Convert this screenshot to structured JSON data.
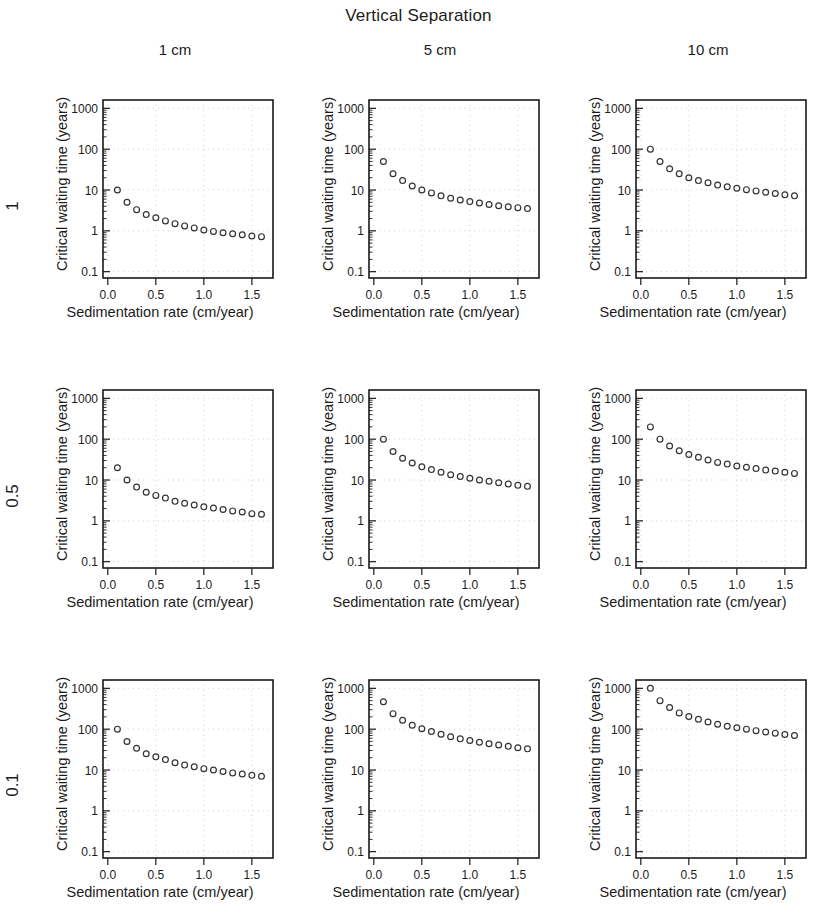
{
  "figure": {
    "title": "Vertical Separation",
    "column_headers": [
      "1 cm",
      "5 cm",
      "10 cm"
    ],
    "row_headers": [
      "1",
      "0.5",
      "0.1"
    ],
    "xlabel": "Sedimentation rate (cm/year)",
    "ylabel": "Critical waiting time (years)",
    "marker_color": "#333333",
    "frame_color": "#1a1a1a",
    "grid_color": "#c8c8c8"
  },
  "chart_data": [
    {
      "type": "scatter",
      "title": "1 cm / 1",
      "row_label": "1",
      "column_label": "1 cm",
      "xlabel": "Sedimentation rate (cm/year)",
      "ylabel": "Critical waiting time (years)",
      "xlim": [
        -0.05,
        1.72
      ],
      "ylim": [
        0.07,
        1600
      ],
      "yscale": "log",
      "xticks": [
        0.0,
        0.5,
        1.0,
        1.5
      ],
      "xticklabels": [
        "0.0",
        "0.5",
        "1.0",
        "1.5"
      ],
      "yticks": [
        0.1,
        1,
        10,
        100,
        1000
      ],
      "yticklabels": [
        "0.1",
        "1",
        "10",
        "100",
        "1000"
      ],
      "grid": true,
      "x": [
        0.1,
        0.2,
        0.3,
        0.4,
        0.5,
        0.6,
        0.7,
        0.8,
        0.9,
        1.0,
        1.1,
        1.2,
        1.3,
        1.4,
        1.5,
        1.6
      ],
      "y": [
        10.0,
        5.0,
        3.3,
        2.5,
        2.1,
        1.75,
        1.5,
        1.32,
        1.18,
        1.05,
        0.97,
        0.9,
        0.85,
        0.8,
        0.75,
        0.72
      ]
    },
    {
      "type": "scatter",
      "title": "5 cm / 1",
      "row_label": "1",
      "column_label": "5 cm",
      "xlabel": "Sedimentation rate (cm/year)",
      "ylabel": "Critical waiting time (years)",
      "xlim": [
        -0.05,
        1.72
      ],
      "ylim": [
        0.07,
        1600
      ],
      "yscale": "log",
      "xticks": [
        0.0,
        0.5,
        1.0,
        1.5
      ],
      "xticklabels": [
        "0.0",
        "0.5",
        "1.0",
        "1.5"
      ],
      "yticks": [
        0.1,
        1,
        10,
        100,
        1000
      ],
      "yticklabels": [
        "0.1",
        "1",
        "10",
        "100",
        "1000"
      ],
      "grid": true,
      "x": [
        0.1,
        0.2,
        0.3,
        0.4,
        0.5,
        0.6,
        0.7,
        0.8,
        0.9,
        1.0,
        1.1,
        1.2,
        1.3,
        1.4,
        1.5,
        1.6
      ],
      "y": [
        50.0,
        25.0,
        17.0,
        12.5,
        10.0,
        8.5,
        7.2,
        6.3,
        5.7,
        5.2,
        4.8,
        4.4,
        4.1,
        3.9,
        3.7,
        3.5
      ]
    },
    {
      "type": "scatter",
      "title": "10 cm / 1",
      "row_label": "1",
      "column_label": "10 cm",
      "xlabel": "Sedimentation rate (cm/year)",
      "ylabel": "Critical waiting time (years)",
      "xlim": [
        -0.05,
        1.72
      ],
      "ylim": [
        0.07,
        1600
      ],
      "yscale": "log",
      "xticks": [
        0.0,
        0.5,
        1.0,
        1.5
      ],
      "xticklabels": [
        "0.0",
        "0.5",
        "1.0",
        "1.5"
      ],
      "yticks": [
        0.1,
        1,
        10,
        100,
        1000
      ],
      "yticklabels": [
        "0.1",
        "1",
        "10",
        "100",
        "1000"
      ],
      "grid": true,
      "x": [
        0.1,
        0.2,
        0.3,
        0.4,
        0.5,
        0.6,
        0.7,
        0.8,
        0.9,
        1.0,
        1.1,
        1.2,
        1.3,
        1.4,
        1.5,
        1.6
      ],
      "y": [
        100.0,
        50.0,
        33.0,
        25.0,
        20.0,
        17.0,
        15.0,
        13.2,
        12.0,
        11.0,
        10.2,
        9.5,
        8.8,
        8.2,
        7.6,
        7.2
      ]
    },
    {
      "type": "scatter",
      "title": "1 cm / 0.5",
      "row_label": "0.5",
      "column_label": "1 cm",
      "xlabel": "Sedimentation rate (cm/year)",
      "ylabel": "Critical waiting time (years)",
      "xlim": [
        -0.05,
        1.72
      ],
      "ylim": [
        0.07,
        1600
      ],
      "yscale": "log",
      "xticks": [
        0.0,
        0.5,
        1.0,
        1.5
      ],
      "xticklabels": [
        "0.0",
        "0.5",
        "1.0",
        "1.5"
      ],
      "yticks": [
        0.1,
        1,
        10,
        100,
        1000
      ],
      "yticklabels": [
        "0.1",
        "1",
        "10",
        "100",
        "1000"
      ],
      "grid": true,
      "x": [
        0.1,
        0.2,
        0.3,
        0.4,
        0.5,
        0.6,
        0.7,
        0.8,
        0.9,
        1.0,
        1.1,
        1.2,
        1.3,
        1.4,
        1.5,
        1.6
      ],
      "y": [
        20.0,
        10.0,
        6.7,
        5.0,
        4.2,
        3.6,
        3.0,
        2.7,
        2.45,
        2.2,
        2.05,
        1.9,
        1.75,
        1.65,
        1.5,
        1.45
      ]
    },
    {
      "type": "scatter",
      "title": "5 cm / 0.5",
      "row_label": "0.5",
      "column_label": "5 cm",
      "xlabel": "Sedimentation rate (cm/year)",
      "ylabel": "Critical waiting time (years)",
      "xlim": [
        -0.05,
        1.72
      ],
      "ylim": [
        0.07,
        1600
      ],
      "yscale": "log",
      "xticks": [
        0.0,
        0.5,
        1.0,
        1.5
      ],
      "xticklabels": [
        "0.0",
        "0.5",
        "1.0",
        "1.5"
      ],
      "yticks": [
        0.1,
        1,
        10,
        100,
        1000
      ],
      "yticklabels": [
        "0.1",
        "1",
        "10",
        "100",
        "1000"
      ],
      "grid": true,
      "x": [
        0.1,
        0.2,
        0.3,
        0.4,
        0.5,
        0.6,
        0.7,
        0.8,
        0.9,
        1.0,
        1.1,
        1.2,
        1.3,
        1.4,
        1.5,
        1.6
      ],
      "y": [
        100.0,
        50.0,
        34.0,
        26.0,
        21.0,
        18.0,
        15.5,
        13.5,
        12.2,
        11.0,
        10.0,
        9.3,
        8.6,
        8.0,
        7.4,
        7.0
      ]
    },
    {
      "type": "scatter",
      "title": "10 cm / 0.5",
      "row_label": "0.5",
      "column_label": "10 cm",
      "xlabel": "Sedimentation rate (cm/year)",
      "ylabel": "Critical waiting time (years)",
      "xlim": [
        -0.05,
        1.72
      ],
      "ylim": [
        0.07,
        1600
      ],
      "yscale": "log",
      "xticks": [
        0.0,
        0.5,
        1.0,
        1.5
      ],
      "xticklabels": [
        "0.0",
        "0.5",
        "1.0",
        "1.5"
      ],
      "yticks": [
        0.1,
        1,
        10,
        100,
        1000
      ],
      "yticklabels": [
        "0.1",
        "1",
        "10",
        "100",
        "1000"
      ],
      "grid": true,
      "x": [
        0.1,
        0.2,
        0.3,
        0.4,
        0.5,
        0.6,
        0.7,
        0.8,
        0.9,
        1.0,
        1.1,
        1.2,
        1.3,
        1.4,
        1.5,
        1.6
      ],
      "y": [
        200.0,
        100.0,
        68.0,
        52.0,
        42.0,
        36.0,
        31.0,
        27.0,
        24.5,
        22.0,
        20.5,
        19.0,
        17.5,
        16.5,
        15.5,
        14.5
      ]
    },
    {
      "type": "scatter",
      "title": "1 cm / 0.1",
      "row_label": "0.1",
      "column_label": "1 cm",
      "xlabel": "Sedimentation rate (cm/year)",
      "ylabel": "Critical waiting time (years)",
      "xlim": [
        -0.05,
        1.72
      ],
      "ylim": [
        0.07,
        1600
      ],
      "yscale": "log",
      "xticks": [
        0.0,
        0.5,
        1.0,
        1.5
      ],
      "xticklabels": [
        "0.0",
        "0.5",
        "1.0",
        "1.5"
      ],
      "yticks": [
        0.1,
        1,
        10,
        100,
        1000
      ],
      "yticklabels": [
        "0.1",
        "1",
        "10",
        "100",
        "1000"
      ],
      "grid": true,
      "x": [
        0.1,
        0.2,
        0.3,
        0.4,
        0.5,
        0.6,
        0.7,
        0.8,
        0.9,
        1.0,
        1.1,
        1.2,
        1.3,
        1.4,
        1.5,
        1.6
      ],
      "y": [
        100.0,
        50.0,
        34.0,
        25.0,
        21.0,
        18.0,
        15.0,
        13.2,
        12.0,
        10.8,
        10.0,
        9.2,
        8.5,
        8.0,
        7.4,
        7.0
      ]
    },
    {
      "type": "scatter",
      "title": "5 cm / 0.1",
      "row_label": "0.1",
      "column_label": "5 cm",
      "xlabel": "Sedimentation rate (cm/year)",
      "ylabel": "Critical waiting time (years)",
      "xlim": [
        -0.05,
        1.72
      ],
      "ylim": [
        0.07,
        1600
      ],
      "yscale": "log",
      "xticks": [
        0.0,
        0.5,
        1.0,
        1.5
      ],
      "xticklabels": [
        "0.0",
        "0.5",
        "1.0",
        "1.5"
      ],
      "yticks": [
        0.1,
        1,
        10,
        100,
        1000
      ],
      "yticklabels": [
        "0.1",
        "1",
        "10",
        "100",
        "1000"
      ],
      "grid": true,
      "x": [
        0.1,
        0.2,
        0.3,
        0.4,
        0.5,
        0.6,
        0.7,
        0.8,
        0.9,
        1.0,
        1.1,
        1.2,
        1.3,
        1.4,
        1.5,
        1.6
      ],
      "y": [
        470.0,
        240.0,
        165.0,
        125.0,
        102.0,
        88.0,
        75.0,
        65.0,
        58.0,
        53.0,
        48.0,
        44.0,
        41.0,
        38.0,
        35.0,
        33.0
      ]
    },
    {
      "type": "scatter",
      "title": "10 cm / 0.1",
      "row_label": "0.1",
      "column_label": "10 cm",
      "xlabel": "Sedimentation rate (cm/year)",
      "ylabel": "Critical waiting time (years)",
      "xlim": [
        -0.05,
        1.72
      ],
      "ylim": [
        0.07,
        1600
      ],
      "yscale": "log",
      "xticks": [
        0.0,
        0.5,
        1.0,
        1.5
      ],
      "xticklabels": [
        "0.0",
        "0.5",
        "1.0",
        "1.5"
      ],
      "yticks": [
        0.1,
        1,
        10,
        100,
        1000
      ],
      "yticklabels": [
        "0.1",
        "1",
        "10",
        "100",
        "1000"
      ],
      "grid": true,
      "x": [
        0.1,
        0.2,
        0.3,
        0.4,
        0.5,
        0.6,
        0.7,
        0.8,
        0.9,
        1.0,
        1.1,
        1.2,
        1.3,
        1.4,
        1.5,
        1.6
      ],
      "y": [
        1000.0,
        500.0,
        340.0,
        250.0,
        205.0,
        175.0,
        150.0,
        132.0,
        118.0,
        108.0,
        100.0,
        92.0,
        85.0,
        80.0,
        74.0,
        70.0
      ]
    }
  ]
}
